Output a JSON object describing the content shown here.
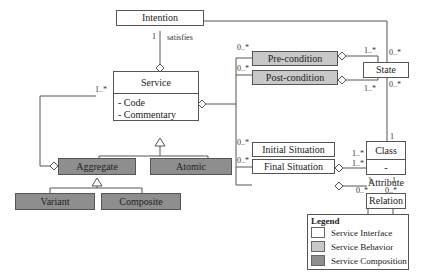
{
  "diagram": {
    "type": "UML class diagram",
    "classes": {
      "intention": {
        "name": "Intention",
        "category": "interface"
      },
      "service": {
        "name": "Service",
        "category": "interface",
        "attributes": [
          "- Code",
          "- Commentary"
        ]
      },
      "aggregate": {
        "name": "Aggregate",
        "category": "composition"
      },
      "atomic": {
        "name": "Atomic",
        "category": "composition"
      },
      "variant": {
        "name": "Variant",
        "category": "composition"
      },
      "composite": {
        "name": "Composite",
        "category": "composition"
      },
      "precondition": {
        "name": "Pre-condition",
        "category": "behavior"
      },
      "postcondition": {
        "name": "Post-condition",
        "category": "behavior"
      },
      "state": {
        "name": "State",
        "category": "interface"
      },
      "initial_situation": {
        "name": "Initial Situation",
        "category": "interface"
      },
      "final_situation": {
        "name": "Final Situation",
        "category": "interface"
      },
      "class": {
        "name": "Class",
        "category": "interface",
        "attributes": [
          "-Attribute"
        ]
      },
      "relation": {
        "name": "Relation",
        "category": "interface"
      }
    },
    "association_labels": {
      "satisfies": "satisfies"
    },
    "multiplicities": {
      "intention_service": "1",
      "service_aggregate": "1..*",
      "pre_service": "0..*",
      "post_service": "0..*",
      "pre_state": "1..*",
      "post_state": "1..*",
      "state_top": "0..*",
      "state_bottom": "0..*",
      "class_state": "1",
      "init_service": "0..*",
      "final_service": "0..*",
      "init_class": "1..*",
      "final_class": "1..*",
      "class_rel_left_top": "1",
      "class_rel_right_top": "1",
      "class_rel_left_bottom": "0..*",
      "class_rel_right_bottom": "0..*"
    }
  },
  "legend": {
    "title": "Legend",
    "items": [
      {
        "label": "Service Interface",
        "color": "#ffffff"
      },
      {
        "label": "Service Behavior",
        "color": "#c8c8c8"
      },
      {
        "label": "Service Composition",
        "color": "#8e8e8e"
      }
    ]
  }
}
